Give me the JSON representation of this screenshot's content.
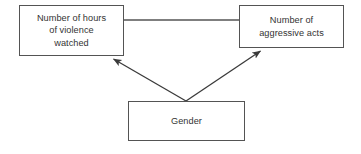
{
  "diagram": {
    "type": "path-model",
    "background_color": "#ffffff",
    "line_color": "#545454",
    "text_color": "#333333",
    "nodes": [
      {
        "id": "violence",
        "label": "Number of hours\nof violence\nwatched",
        "x": 19,
        "y": 5,
        "width": 105,
        "height": 51
      },
      {
        "id": "aggression",
        "label": "Number of\naggressive acts",
        "x": 239,
        "y": 5,
        "width": 105,
        "height": 43
      },
      {
        "id": "gender",
        "label": "Gender",
        "x": 128,
        "y": 101,
        "width": 117,
        "height": 40
      }
    ],
    "edges": [
      {
        "id": "violence-aggression",
        "from": "violence",
        "to": "aggression",
        "arrowhead": "none",
        "x1": 124,
        "y1": 20,
        "x2": 239,
        "y2": 20
      },
      {
        "id": "gender-violence",
        "from": "gender",
        "to": "violence",
        "arrowhead": "end",
        "x1": 186,
        "y1": 101,
        "x2": 112,
        "y2": 58
      },
      {
        "id": "gender-aggression",
        "from": "gender",
        "to": "aggression",
        "arrowhead": "end",
        "x1": 186,
        "y1": 101,
        "x2": 262,
        "y2": 50
      }
    ]
  }
}
